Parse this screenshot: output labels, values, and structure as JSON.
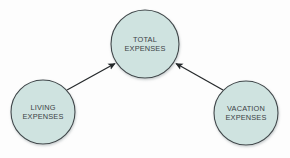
{
  "diagram": {
    "type": "node-link-flow",
    "background_color": "#fdfdfd",
    "node_fill_color": "#cfe3e0",
    "node_stroke_color": "#3f4649",
    "arrow_color": "#25292b",
    "label_color": "#3b4245",
    "nodes": [
      {
        "id": "total-expenses",
        "line1": "TOTAL",
        "line2": "EXPENSES",
        "cx": 145,
        "cy": 44,
        "r": 34
      },
      {
        "id": "living-expenses",
        "line1": "LIVING",
        "line2": "EXPENSES",
        "cx": 43,
        "cy": 112,
        "r": 32
      },
      {
        "id": "vacation-expenses",
        "line1": "VACATION",
        "line2": "EXPENSES",
        "cx": 246,
        "cy": 113,
        "r": 32
      }
    ],
    "edges": [
      {
        "id": "living-to-total",
        "from": "living-expenses",
        "to": "total-expenses",
        "x1": 67,
        "y1": 90,
        "x2": 115,
        "y2": 63
      },
      {
        "id": "vacation-to-total",
        "from": "vacation-expenses",
        "to": "total-expenses",
        "x1": 223,
        "y1": 90,
        "x2": 176,
        "y2": 63
      }
    ]
  }
}
